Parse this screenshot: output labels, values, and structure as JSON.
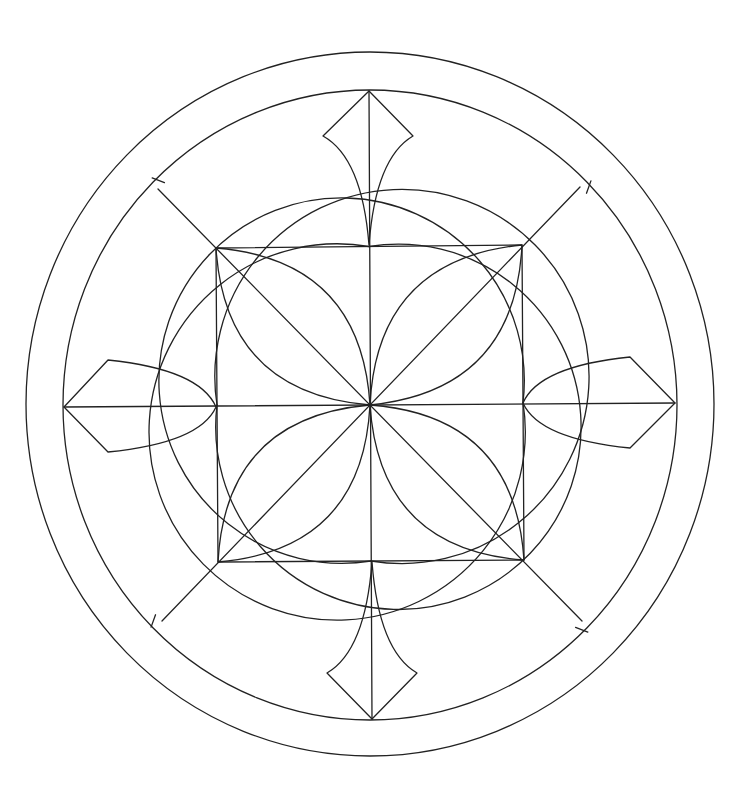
{
  "figure": {
    "stroke_color": "#222222",
    "background": "#ffffff",
    "center": [
      370,
      405
    ],
    "outer_ring": {
      "cx": 370,
      "cy": 404,
      "rx": 344,
      "ry": 352
    },
    "inner_ring": {
      "cx": 370,
      "cy": 405,
      "rx": 307,
      "ry": 315
    },
    "square": {
      "tl": [
        216,
        248
      ],
      "tr": [
        522,
        245
      ],
      "br": [
        524,
        560
      ],
      "bl": [
        218,
        562
      ]
    },
    "axes": {
      "top": [
        369,
        91
      ],
      "bottom": [
        372,
        719
      ],
      "left": [
        64,
        407
      ],
      "right": [
        675,
        403
      ]
    },
    "diagonal_ends": {
      "tl": [
        158,
        189
      ],
      "tr": [
        580,
        187
      ],
      "br": [
        582,
        621
      ],
      "bl": [
        162,
        621
      ]
    },
    "kites": [
      {
        "name": "top",
        "tip": [
          369,
          91
        ],
        "a": [
          323,
          136
        ],
        "b": [
          413,
          136
        ],
        "base": [
          369,
          245
        ]
      },
      {
        "name": "bottom",
        "tip": [
          372,
          719
        ],
        "a": [
          327,
          673
        ],
        "b": [
          417,
          673
        ],
        "base": [
          372,
          562
        ]
      },
      {
        "name": "left",
        "tip": [
          64,
          407
        ],
        "a": [
          108,
          360
        ],
        "b": [
          108,
          452
        ],
        "base": [
          216,
          407
        ]
      },
      {
        "name": "right",
        "tip": [
          675,
          403
        ],
        "a": [
          630,
          357
        ],
        "b": [
          630,
          448
        ],
        "base": [
          523,
          403
        ]
      }
    ]
  }
}
